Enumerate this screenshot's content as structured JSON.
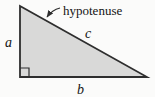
{
  "diagram": {
    "labels": {
      "hypotenuse_callout": "hypotenuse",
      "side_a": "a",
      "side_b": "b",
      "side_c": "c"
    },
    "icons": {
      "arrow": "callout-arrow-icon",
      "right_angle": "right-angle-marker"
    },
    "colors": {
      "triangle_fill": "#d9d9d8",
      "line": "#2e2e2e",
      "text": "#141414",
      "background": "#fbfbfa"
    }
  }
}
